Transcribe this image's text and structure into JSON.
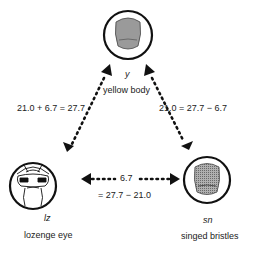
{
  "diagram": {
    "nodes": [
      {
        "id": "y",
        "symbol": "y",
        "name": "yellow body"
      },
      {
        "id": "lz",
        "symbol": "lz",
        "name": "lozenge eye"
      },
      {
        "id": "sn",
        "symbol": "sn",
        "name": "singed bristles"
      }
    ],
    "edges": [
      {
        "from": "y",
        "to": "lz",
        "label": "21.0 + 6.7 = 27.7"
      },
      {
        "from": "y",
        "to": "sn",
        "label": "21.0 = 27.7 − 6.7"
      },
      {
        "from": "lz",
        "to": "sn",
        "label_top": "6.7",
        "label_bottom": "= 27.7 − 21.0"
      }
    ],
    "colors": {
      "line": "#111111",
      "body_fill": "#999999"
    }
  }
}
